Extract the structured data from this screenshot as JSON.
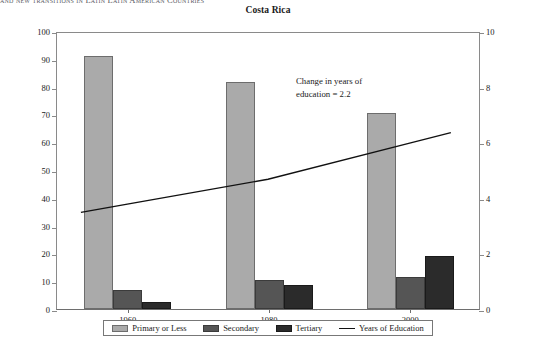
{
  "running_head": "and new transitions in Latin Latin American Countries",
  "chart_title": "Costa Rica",
  "annotation": "Change in years of\neducation = 2.2",
  "axes": {
    "left_ticks": [
      "0",
      "10",
      "20",
      "30",
      "40",
      "50",
      "60",
      "70",
      "80",
      "90",
      "100"
    ],
    "right_ticks": [
      "0",
      "2",
      "4",
      "6",
      "8",
      "10"
    ],
    "x_ticks": [
      "1960",
      "1980",
      "2000"
    ]
  },
  "legend": {
    "items": [
      {
        "label": "Primary or Less",
        "swatch": "primary-swatch",
        "color": "#aaaaaa"
      },
      {
        "label": "Secondary",
        "swatch": "secondary-swatch",
        "color": "#555555"
      },
      {
        "label": "Tertiary",
        "swatch": "tertiary-swatch",
        "color": "#2b2b2b"
      },
      {
        "label": "Years of Education",
        "swatch": "line-swatch",
        "color": "#111111"
      }
    ]
  },
  "chart_data": {
    "type": "bar",
    "title": "Costa Rica",
    "xlabel": "",
    "ylabel": "",
    "ylim": [
      0,
      100
    ],
    "y2lim": [
      0,
      10
    ],
    "grid": false,
    "legend_position": "bottom",
    "categories": [
      "1960",
      "1980",
      "2000"
    ],
    "series": [
      {
        "name": "Primary or Less",
        "axis": "left",
        "type": "bar",
        "color": "#aaaaaa",
        "values": [
          91,
          81.5,
          70.5
        ]
      },
      {
        "name": "Secondary",
        "axis": "left",
        "type": "bar",
        "color": "#555555",
        "values": [
          7,
          10.5,
          11.5
        ]
      },
      {
        "name": "Tertiary",
        "axis": "left",
        "type": "bar",
        "color": "#2b2b2b",
        "values": [
          2.5,
          8.5,
          19
        ]
      },
      {
        "name": "Years of Education",
        "axis": "right",
        "type": "line",
        "color": "#111111",
        "values": [
          3.8,
          4.7,
          6.0
        ]
      }
    ],
    "annotations": [
      {
        "text": "Change in years of education = 2.2",
        "value": 2.2
      }
    ]
  }
}
